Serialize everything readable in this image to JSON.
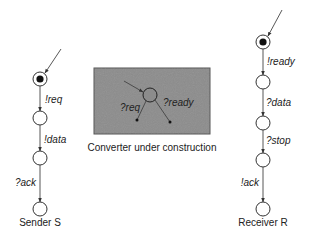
{
  "sender": {
    "caption": "Sender S",
    "transitions": [
      "!req",
      "!data",
      "?ack"
    ]
  },
  "converter": {
    "caption": "Converter under construction",
    "transitions": [
      "?req",
      "?ready"
    ],
    "box_color": "#8c8c8c"
  },
  "receiver": {
    "caption": "Receiver R",
    "transitions": [
      "!ready",
      "?data",
      "?stop",
      "!ack"
    ]
  }
}
